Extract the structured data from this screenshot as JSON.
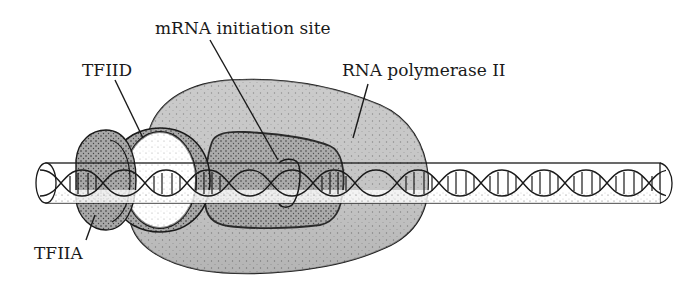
{
  "figure": {
    "labels": {
      "mrna_initiation_site": "mRNA initiation site",
      "tfiid": "TFIID",
      "rna_polymerase_ii": "RNA polymerase II",
      "tfiia": "TFIIA"
    },
    "components": [
      {
        "name": "TFIIA",
        "shape": "ring-clamp",
        "fill": "#b8b8b8"
      },
      {
        "name": "TFIID",
        "shape": "ring-clamp",
        "fill": "#ffffff"
      },
      {
        "name": "RNA polymerase II",
        "shape": "large-lobe",
        "fill": "#c4c4c4"
      },
      {
        "name": "DNA",
        "shape": "double-helix-in-tube",
        "fill": "#ffffff"
      }
    ],
    "colors": {
      "stroke": "#1a1a1a",
      "polymerase_fill": "#c6c6c6",
      "inner_fill": "#b5b5b5",
      "tfiia_fill": "#b0b0b0",
      "background": "#ffffff"
    }
  }
}
